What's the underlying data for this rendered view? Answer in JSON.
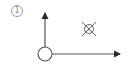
{
  "figure": {
    "label": "1"
  },
  "elements": {
    "origin": {
      "shape": "circle",
      "cx": 45,
      "cy": 54,
      "r": 7
    },
    "vertical_axis": {
      "x1": 45,
      "y1": 47,
      "x2": 45,
      "y2": 12,
      "arrowhead": "up"
    },
    "horizontal_axis": {
      "x1": 52,
      "y1": 54,
      "x2": 121,
      "y2": 54,
      "arrowhead": "right"
    },
    "into_page_symbol": {
      "shape": "circle-with-x",
      "cx": 89,
      "cy": 29,
      "r": 4.5,
      "x_extent": 7
    }
  },
  "colors": {
    "stroke": "#555555",
    "arrow": "#2a2a2a",
    "label": "#8a8a8a",
    "background": "#ffffff"
  }
}
